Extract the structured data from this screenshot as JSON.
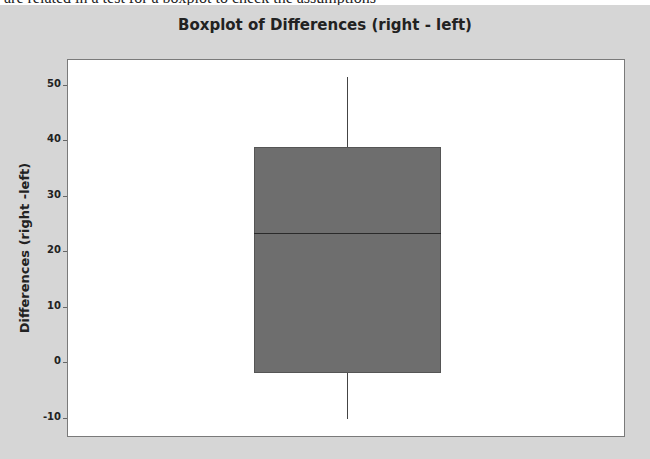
{
  "doc_text": "are related in a test for a boxplot to check the assumptions",
  "colors": {
    "panel_bg": "#d6d6d6",
    "plot_bg": "#ffffff",
    "box_fill": "#6e6e6e",
    "median_line": "#2a2a2a"
  },
  "chart_data": {
    "type": "boxplot",
    "title": "Boxplot of Differences (right - left)",
    "xlabel": "",
    "ylabel": "Differences (right -left)",
    "yticks": [
      -10,
      0,
      10,
      20,
      30,
      40,
      50
    ],
    "ylim": [
      -13.5,
      54.5
    ],
    "grid": false,
    "legend": null,
    "series": [
      {
        "name": "Differences",
        "whisker_low": -10.3,
        "q1": -2.0,
        "median": 23.2,
        "q3": 38.7,
        "whisker_high": 51.4
      }
    ]
  }
}
